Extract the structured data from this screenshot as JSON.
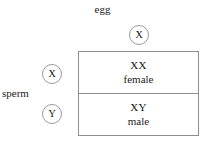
{
  "diagram": {
    "title_top": "egg",
    "title_left": "sperm",
    "gametes": {
      "egg": [
        {
          "allele": "X"
        }
      ],
      "sperm": [
        {
          "allele": "X"
        },
        {
          "allele": "Y"
        }
      ]
    },
    "cells": [
      {
        "genotype": "XX",
        "phenotype": "female"
      },
      {
        "genotype": "XY",
        "phenotype": "male"
      }
    ],
    "colors": {
      "background": "#ffffff",
      "border": "#8d8d8d",
      "circle_stroke": "#9a9a9a",
      "text": "#111111"
    }
  }
}
